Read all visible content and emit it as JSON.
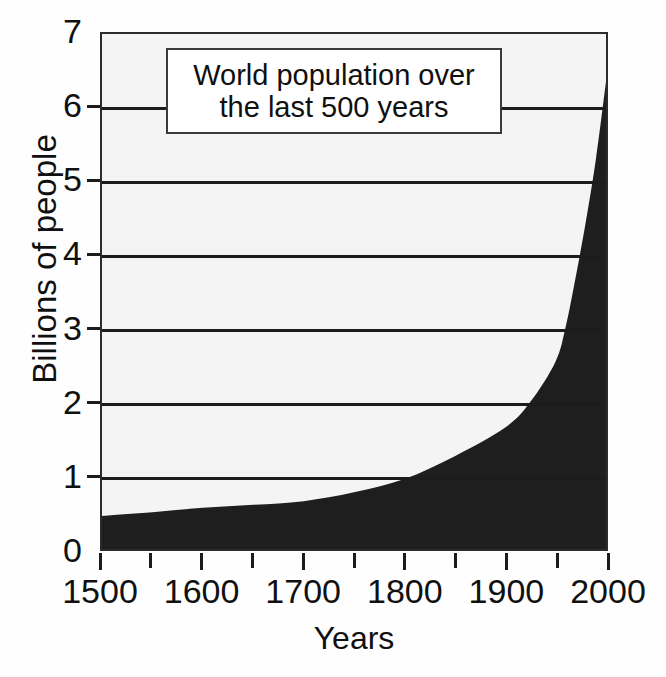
{
  "chart_data": {
    "type": "area",
    "title": "World population over the last 500 years",
    "title_line_1": "World population over",
    "title_line_2": "the last 500 years",
    "xlabel": "Years",
    "ylabel": "Billions of people",
    "xlim": [
      1500,
      2000
    ],
    "ylim": [
      0,
      7
    ],
    "x_tick_labels": [
      "1500",
      "1600",
      "1700",
      "1800",
      "1900",
      "2000"
    ],
    "x_ticks": [
      1500,
      1600,
      1700,
      1800,
      1900,
      2000
    ],
    "x_minor_ticks": [
      1550,
      1650,
      1750,
      1850,
      1950
    ],
    "y_tick_labels": [
      "0",
      "1",
      "2",
      "3",
      "4",
      "5",
      "6",
      "7"
    ],
    "y_ticks": [
      0,
      1,
      2,
      3,
      4,
      5,
      6,
      7
    ],
    "grid": "horizontal",
    "legend": "none",
    "fill_color": "#1e1e1e",
    "plot_background": "#f4f4f4",
    "axis_color": "#1c1c1c",
    "x": [
      1500,
      1550,
      1600,
      1650,
      1700,
      1750,
      1800,
      1850,
      1900,
      1925,
      1950,
      1960,
      1970,
      1980,
      1990,
      2000
    ],
    "values": [
      0.45,
      0.5,
      0.56,
      0.6,
      0.65,
      0.77,
      0.95,
      1.26,
      1.65,
      2.0,
      2.55,
      3.02,
      3.7,
      4.45,
      5.3,
      6.35
    ],
    "series": [
      {
        "name": "World population",
        "values": [
          0.45,
          0.5,
          0.56,
          0.6,
          0.65,
          0.77,
          0.95,
          1.26,
          1.65,
          2.0,
          2.55,
          3.02,
          3.7,
          4.45,
          5.3,
          6.35
        ]
      }
    ]
  },
  "bleed_through": {
    "line_1": "Over 100 pe",
    "line_2": "the last nine",
    "line_3": "opulation",
    "line_4": "more identical",
    "line_5": "above the culture"
  }
}
